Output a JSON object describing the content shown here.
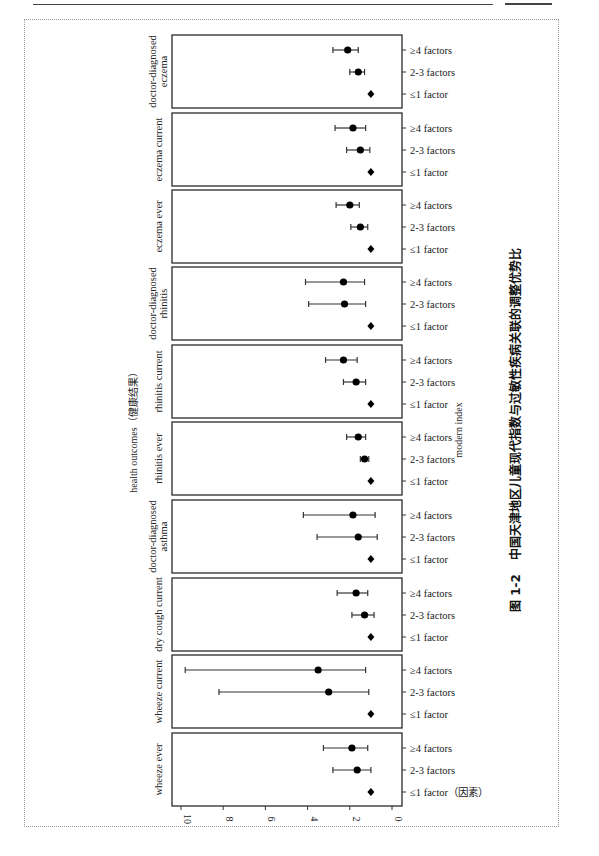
{
  "figure": {
    "caption_number": "图 1-2",
    "caption_text": "中国天津地区儿童现代指数与过敏性疾病关联的调整优势比",
    "x_axis_title": "health outcomes（健康结果）",
    "y_axis_title": "modern index",
    "reference_suffix": "（因素）"
  },
  "chart_data": {
    "type": "forest",
    "title": "图 1-2 中国天津地区儿童现代指数与过敏性疾病关联的调整优势比",
    "orientation": "rotated 90° (value axis runs right-to-left along bottom)",
    "value_axis": {
      "label": "",
      "ticks": [
        10,
        8,
        6,
        4,
        2,
        0
      ],
      "range": [
        0,
        10.5
      ]
    },
    "category_axis_label": "modern index",
    "panel_axis_label": "health outcomes（健康结果）",
    "row_labels": [
      "≥4 factors",
      "2-3 factors",
      "≤1 factor"
    ],
    "legend": {
      "point": "circle = adjusted OR with 95% CI",
      "reference": "diamond = reference (≤1 factor, OR=1)"
    },
    "panels": [
      {
        "outcome": "doctor-diagnosed eczema",
        "rows": [
          {
            "group": "≥4 factors",
            "or": 2.1,
            "lo": 1.6,
            "hi": 2.8
          },
          {
            "group": "2-3 factors",
            "or": 1.6,
            "lo": 1.3,
            "hi": 2.0
          },
          {
            "group": "≤1 factor",
            "or": 1.0,
            "reference": true
          }
        ]
      },
      {
        "outcome": "eczema current",
        "rows": [
          {
            "group": "≥4 factors",
            "or": 1.85,
            "lo": 1.25,
            "hi": 2.7
          },
          {
            "group": "2-3 factors",
            "or": 1.5,
            "lo": 1.05,
            "hi": 2.15
          },
          {
            "group": "≤1 factor",
            "or": 1.0,
            "reference": true
          }
        ]
      },
      {
        "outcome": "eczema ever",
        "rows": [
          {
            "group": "≥4 factors",
            "or": 2.0,
            "lo": 1.55,
            "hi": 2.65
          },
          {
            "group": "2-3 factors",
            "or": 1.5,
            "lo": 1.15,
            "hi": 1.95
          },
          {
            "group": "≤1 factor",
            "or": 1.0,
            "reference": true
          }
        ]
      },
      {
        "outcome": "doctor-diagnosed rhinitis",
        "rows": [
          {
            "group": "≥4 factors",
            "or": 2.3,
            "lo": 1.3,
            "hi": 4.1
          },
          {
            "group": "2-3 factors",
            "or": 2.25,
            "lo": 1.25,
            "hi": 3.95
          },
          {
            "group": "≤1 factor",
            "or": 1.0,
            "reference": true
          }
        ]
      },
      {
        "outcome": "rhinitis current",
        "rows": [
          {
            "group": "≥4 factors",
            "or": 2.3,
            "lo": 1.65,
            "hi": 3.15
          },
          {
            "group": "2-3 factors",
            "or": 1.7,
            "lo": 1.25,
            "hi": 2.3
          },
          {
            "group": "≤1 factor",
            "or": 1.0,
            "reference": true
          }
        ]
      },
      {
        "outcome": "rhinitis ever",
        "rows": [
          {
            "group": "≥4 factors",
            "or": 1.6,
            "lo": 1.25,
            "hi": 2.15
          },
          {
            "group": "2-3 factors",
            "or": 1.3,
            "lo": 1.1,
            "hi": 1.5
          },
          {
            "group": "≤1 factor",
            "or": 1.0,
            "reference": true
          }
        ]
      },
      {
        "outcome": "doctor-diagnosed asthma",
        "rows": [
          {
            "group": "≥4 factors",
            "or": 1.85,
            "lo": 0.8,
            "hi": 4.2
          },
          {
            "group": "2-3 factors",
            "or": 1.6,
            "lo": 0.7,
            "hi": 3.55
          },
          {
            "group": "≤1 factor",
            "or": 1.0,
            "reference": true
          }
        ]
      },
      {
        "outcome": "dry cough current",
        "rows": [
          {
            "group": "≥4 factors",
            "or": 1.7,
            "lo": 1.15,
            "hi": 2.6
          },
          {
            "group": "2-3 factors",
            "or": 1.3,
            "lo": 0.85,
            "hi": 1.9
          },
          {
            "group": "≤1 factor",
            "or": 1.0,
            "reference": true
          }
        ]
      },
      {
        "outcome": "wheeze current",
        "rows": [
          {
            "group": "≥4 factors",
            "or": 3.5,
            "lo": 1.25,
            "hi": 9.8
          },
          {
            "group": "2-3 factors",
            "or": 3.0,
            "lo": 1.1,
            "hi": 8.2
          },
          {
            "group": "≤1 factor",
            "or": 1.0,
            "reference": true
          }
        ]
      },
      {
        "outcome": "wheeze ever",
        "rows": [
          {
            "group": "≥4 factors",
            "or": 1.9,
            "lo": 1.15,
            "hi": 3.25
          },
          {
            "group": "2-3 factors",
            "or": 1.65,
            "lo": 1.0,
            "hi": 2.8
          },
          {
            "group": "≤1 factor",
            "or": 1.0,
            "reference": true
          }
        ]
      }
    ],
    "panel_labels_display": [
      [
        "doctor-diagnosed",
        "eczema"
      ],
      [
        "eczema current"
      ],
      [
        "eczema ever"
      ],
      [
        "doctor-diagnosed",
        "rhinitis"
      ],
      [
        "rhinitis current"
      ],
      [
        "rhinitis ever"
      ],
      [
        "doctor-diagnosed",
        "asthma"
      ],
      [
        "dry cough current"
      ],
      [
        "wheeze current"
      ],
      [
        "wheeze ever"
      ]
    ]
  }
}
